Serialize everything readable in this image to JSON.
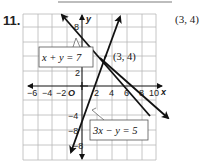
{
  "problem": {
    "number": "11.",
    "answer": "(3, 4)"
  },
  "graph": {
    "x_axis_label": "x",
    "y_axis_label": "y",
    "origin_label": "O",
    "x_ticks": [
      "−6",
      "−4",
      "−2",
      "2",
      "4",
      "6",
      "8",
      "10"
    ],
    "y_ticks": [
      "8",
      "2",
      "−4",
      "−8",
      "−8"
    ],
    "intersection_label": "(3, 4)",
    "equations": [
      {
        "label": "x + y = 7",
        "slope": -1,
        "intercept": 7
      },
      {
        "label": "3x − y = 5",
        "slope": 3,
        "intercept": -5
      }
    ],
    "line_color": "#111111",
    "grid_color": "#b8b8b8"
  }
}
